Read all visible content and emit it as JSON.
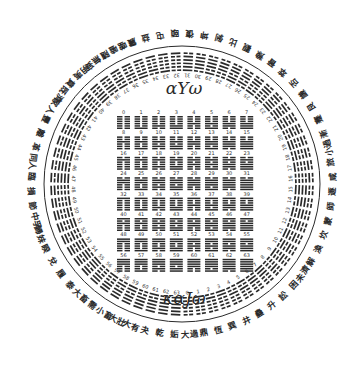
{
  "diagram": {
    "title_top": "αΥω",
    "title_bottom": "καJω",
    "colors": {
      "ink": "#2a2a2a",
      "background": "#ffffff"
    },
    "center": [
      182,
      184
    ],
    "ring": {
      "line_radius": 138,
      "hexagram_inner_radius": 107,
      "hexagram_outer_radius": 133,
      "label_radius": 151,
      "count": 64
    },
    "grid": {
      "columns": 8,
      "rows": 8,
      "x0": 117,
      "y0": 110,
      "col_step": 17.6,
      "row_step": 20.4
    },
    "grid_numbers": [
      0,
      1,
      2,
      3,
      4,
      5,
      6,
      7,
      8,
      9,
      10,
      11,
      12,
      13,
      14,
      15,
      16,
      17,
      18,
      19,
      20,
      21,
      22,
      23,
      24,
      25,
      26,
      27,
      28,
      29,
      30,
      31,
      32,
      33,
      34,
      35,
      36,
      37,
      38,
      39,
      40,
      41,
      42,
      43,
      44,
      45,
      46,
      47,
      48,
      49,
      50,
      51,
      52,
      53,
      54,
      55,
      56,
      57,
      58,
      59,
      60,
      61,
      62,
      63
    ],
    "ring_labels_visible": [
      "大過",
      "鼎",
      "恆",
      "巽",
      "井",
      "蠱",
      "升",
      "訟",
      "困",
      "未濟",
      "解",
      "渙",
      "坎",
      "蒙",
      "師",
      "遯",
      "咸",
      "旅",
      "小過",
      "漸",
      "蹇",
      "艮",
      "謙",
      "否",
      "萃",
      "晉",
      "豫",
      "觀",
      "比",
      "剝",
      "坤",
      "復",
      "頤",
      "屯",
      "益",
      "震",
      "噬嗑",
      "隨",
      "無妄",
      "明夷",
      "賁",
      "既濟",
      "家人",
      "豐",
      "離",
      "革",
      "同人",
      "臨",
      "損",
      "節",
      "中孚",
      "歸妹",
      "睽",
      "兌",
      "履",
      "泰",
      "大畜",
      "需",
      "小畜",
      "大壯",
      "大有",
      "夬",
      "乾",
      "姤"
    ]
  }
}
